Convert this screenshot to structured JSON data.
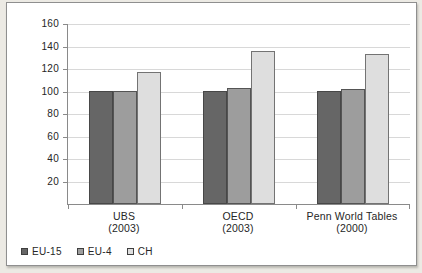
{
  "chart_data": {
    "type": "bar",
    "categories": [
      {
        "label": "UBS",
        "sub": "(2003)"
      },
      {
        "label": "OECD",
        "sub": "(2003)"
      },
      {
        "label": "Penn World Tables",
        "sub": "(2000)"
      }
    ],
    "series": [
      {
        "name": "EU-15",
        "color": "#666666",
        "border": "#474747",
        "values": [
          100,
          100,
          100
        ]
      },
      {
        "name": "EU-4",
        "color": "#9d9d9d",
        "border": "#545454",
        "values": [
          100,
          103,
          102
        ]
      },
      {
        "name": "CH",
        "color": "#dedede",
        "border": "#737373",
        "values": [
          117,
          136,
          133
        ]
      }
    ],
    "title": "",
    "xlabel": "",
    "ylabel": "",
    "ylim": [
      0,
      160
    ],
    "yticks": [
      20,
      40,
      60,
      80,
      100,
      120,
      140,
      160
    ],
    "grid": true,
    "legend_position": "bottom-left",
    "colors": {
      "gridline": "#d8d8d8",
      "axis": "#8a8a8a",
      "text": "#262626",
      "panel_border": "#8f8f8f",
      "panel_bg": "#ffffff",
      "page_bg": "#eceae4"
    }
  }
}
